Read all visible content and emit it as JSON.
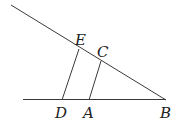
{
  "diagram": {
    "points": {
      "E": {
        "label": "E",
        "x": 79,
        "y": 49,
        "lx": 75,
        "ly": 45
      },
      "C": {
        "label": "C",
        "x": 101,
        "y": 61,
        "lx": 97,
        "ly": 57
      },
      "D": {
        "label": "D",
        "x": 62,
        "y": 100,
        "lx": 55,
        "ly": 118
      },
      "A": {
        "label": "A",
        "x": 89,
        "y": 100,
        "lx": 83,
        "ly": 118
      },
      "B": {
        "label": "B",
        "x": 166,
        "y": 100,
        "lx": 160,
        "ly": 118
      }
    },
    "lines": [
      {
        "name": "upper-line",
        "x1": 11,
        "y1": 5,
        "x2": 166,
        "y2": 100
      },
      {
        "name": "lower-line",
        "x1": 23,
        "y1": 99.5,
        "x2": 166,
        "y2": 99.5
      },
      {
        "name": "segment-ED",
        "x1": 79,
        "y1": 49,
        "x2": 62,
        "y2": 100
      },
      {
        "name": "segment-CA",
        "x1": 101,
        "y1": 61,
        "x2": 89,
        "y2": 100
      }
    ]
  }
}
